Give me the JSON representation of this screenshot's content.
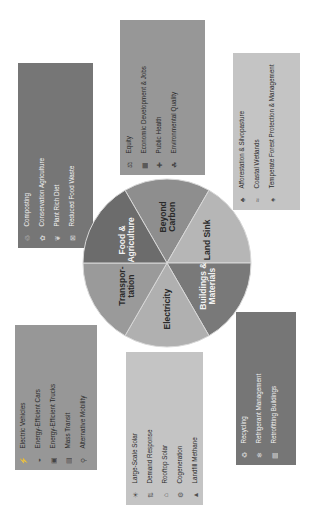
{
  "pie": {
    "segments": [
      {
        "label_lines": [
          "Beyond",
          "Carbon"
        ],
        "color": "#8e8e8e",
        "text_color": "#2a2a2a"
      },
      {
        "label_lines": [
          "Land Sink"
        ],
        "color": "#b6b6b6",
        "text_color": "#2a2a2a"
      },
      {
        "label_lines": [
          "Buildings &",
          "Materials"
        ],
        "color": "#797979",
        "text_color": "#f2f2f2"
      },
      {
        "label_lines": [
          "Electricity"
        ],
        "color": "#b0b0b0",
        "text_color": "#2a2a2a"
      },
      {
        "label_lines": [
          "Transpor-",
          "tation"
        ],
        "color": "#9a9a9a",
        "text_color": "#2a2a2a"
      },
      {
        "label_lines": [
          "Food &",
          "Agriculture"
        ],
        "color": "#6c6c6c",
        "text_color": "#f2f2f2"
      }
    ]
  },
  "boxes": {
    "food_agriculture": {
      "items": [
        {
          "icon": "compost-icon",
          "glyph": "♲",
          "label": "Composting"
        },
        {
          "icon": "tractor-icon",
          "glyph": "✿",
          "label": "Conservation Agriculture"
        },
        {
          "icon": "plant-icon",
          "glyph": "❦",
          "label": "Plant Rich Diet"
        },
        {
          "icon": "food-waste-icon",
          "glyph": "⊠",
          "label": "Reduced Food Waste"
        }
      ]
    },
    "beyond_carbon": {
      "items": [
        {
          "icon": "equity-icon",
          "glyph": "⚖",
          "label": "Equity"
        },
        {
          "icon": "economy-icon",
          "glyph": "▦",
          "label": "Economic Development & Jobs"
        },
        {
          "icon": "health-icon",
          "glyph": "✚",
          "label": "Public Health"
        },
        {
          "icon": "environment-icon",
          "glyph": "☘",
          "label": "Environmental Quality"
        }
      ]
    },
    "land_sink": {
      "items": [
        {
          "icon": "tree-icon",
          "glyph": "♣",
          "label": "Afforestation & Silvopasture"
        },
        {
          "icon": "wetland-icon",
          "glyph": "≈",
          "label": "Coastal Wetlands"
        },
        {
          "icon": "forest-icon",
          "glyph": "♠",
          "label": "Temperate Forest Protection & Management"
        }
      ]
    },
    "transportation": {
      "items": [
        {
          "icon": "ev-icon",
          "glyph": "⚡",
          "label": "Electric Vehicles"
        },
        {
          "icon": "car-icon",
          "glyph": "◒",
          "label": "Energy-Efficient Cars"
        },
        {
          "icon": "truck-icon",
          "glyph": "▣",
          "label": "Energy-Efficient Trucks"
        },
        {
          "icon": "transit-icon",
          "glyph": "▤",
          "label": "Mass Transit"
        },
        {
          "icon": "bike-icon",
          "glyph": "⚲",
          "label": "Alternative Mobility"
        }
      ]
    },
    "electricity": {
      "items": [
        {
          "icon": "solar-farm-icon",
          "glyph": "☀",
          "label": "Large-Scale Solar"
        },
        {
          "icon": "demand-icon",
          "glyph": "⇅",
          "label": "Demand Response"
        },
        {
          "icon": "rooftop-solar-icon",
          "glyph": "⌂",
          "label": "Rooftop Solar"
        },
        {
          "icon": "cogeneration-icon",
          "glyph": "⚙",
          "label": "Cogeneration"
        },
        {
          "icon": "landfill-icon",
          "glyph": "▲",
          "label": "Landfill Methane"
        }
      ]
    },
    "buildings_materials": {
      "items": [
        {
          "icon": "recycle-icon",
          "glyph": "♻",
          "label": "Recycling"
        },
        {
          "icon": "refrigerant-icon",
          "glyph": "❄",
          "label": "Refrigerant Management"
        },
        {
          "icon": "building-icon",
          "glyph": "▥",
          "label": "Retrofitting Buildings"
        }
      ]
    }
  }
}
